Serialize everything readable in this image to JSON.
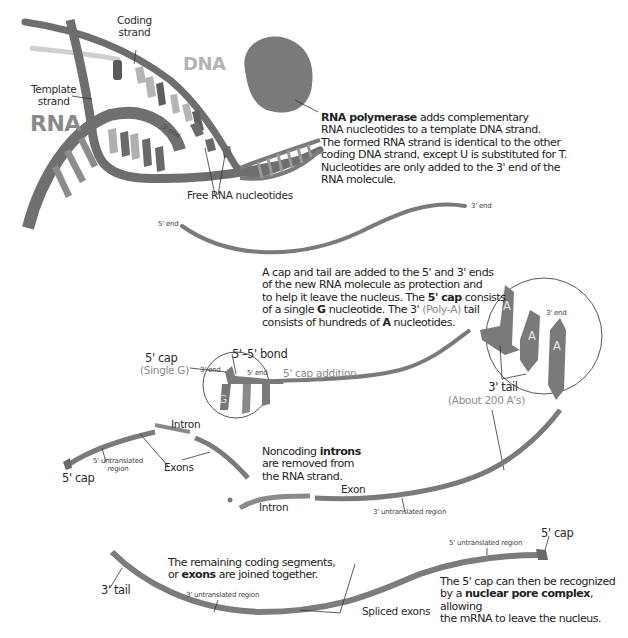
{
  "colors": {
    "strand_dark": "#6e6e6e",
    "strand_mid": "#8a8a8a",
    "strand_light": "#b8b8b8",
    "polymerase": "#7c7c7c",
    "text": "#222222",
    "background": "#ffffff"
  },
  "stage1_transcription": {
    "labels": {
      "coding_strand": [
        "Coding",
        "strand"
      ],
      "dna": "DNA",
      "template_strand": [
        "Template",
        "strand"
      ],
      "rna": "RNA",
      "five_end": "5' end",
      "three_end": "3' end",
      "free_nucleotides": "Free RNA nucleotides"
    },
    "dna_bases": [
      "A",
      "G",
      "T",
      "C",
      "C",
      "A"
    ],
    "rna_bases_top": [
      "A",
      "G",
      "U",
      "C"
    ],
    "rna_bases_bottom": [
      "C",
      "A",
      "G"
    ],
    "description": {
      "bold": "RNA polymerase",
      "line1_rest": " adds complementary",
      "line2": "RNA nucleotides to a template DNA strand.",
      "line3": "The formed RNA strand is identical to the other",
      "line4": "coding DNA strand, except U is substituted for T.",
      "line5": "Nucleotides are only added to the 3' end of the",
      "line6": "RNA molecule."
    }
  },
  "stage2_rna_molecule": {
    "five_end": "5' end",
    "three_end": "3' end"
  },
  "stage3_cap_tail": {
    "description": {
      "line1": "A cap and tail are added to the 5' and 3' ends",
      "line2": "of the new RNA molecule as protection and",
      "line3_pre": "to help it leave the nucleus. The ",
      "line3_bold": "5' cap",
      "line3_post": " consists",
      "line4_pre": "of a single ",
      "line4_bold": "G",
      "line4_mid": " nucleotide. The 3' ",
      "line4_light": "(Poly-A)",
      "line4_post": " tail",
      "line5_pre": "consists of hundreds of ",
      "line5_bold": "A",
      "line5_post": " nucleotides."
    },
    "five_cap": "5' cap",
    "single_g": "(Single G)",
    "bond": "5'–5' bond",
    "three_end_small": "3' end",
    "five_end_small": "5' end",
    "cap_addition": "5' cap addition",
    "cap_base": "G",
    "tail_bases": [
      "A",
      "A",
      "A"
    ],
    "tail_three_end": "3' end",
    "three_tail": "3' tail",
    "about_200": "(About 200 A's)"
  },
  "stage4_splicing": {
    "intron_top": "Intron",
    "exons": "Exons",
    "five_utr": [
      "5' untranslated",
      "region"
    ],
    "five_cap": "5' cap",
    "description": {
      "line1_pre": "Noncoding ",
      "line1_bold": "introns",
      "line2": "are removed from",
      "line3": "the RNA strand."
    },
    "exon": "Exon",
    "intron_bottom": "Intron",
    "three_utr": "3' untranslated region"
  },
  "stage5_mature_mrna": {
    "five_utr": "5' untranslated region",
    "five_cap": "5' cap",
    "three_tail": "3' tail",
    "three_utr": "3' untranslated region",
    "spliced_exons": "Spliced exons",
    "joined_description": {
      "line1": "The remaining coding segments,",
      "line2_pre": "or ",
      "line2_bold": "exons",
      "line2_post": " are joined together."
    },
    "export_description": {
      "line1": "The 5' cap can then be recognized",
      "line2_pre": "by a ",
      "line2_bold": "nuclear pore complex",
      "line2_post": ", allowing",
      "line3": "the mRNA to leave the nucleus."
    }
  }
}
